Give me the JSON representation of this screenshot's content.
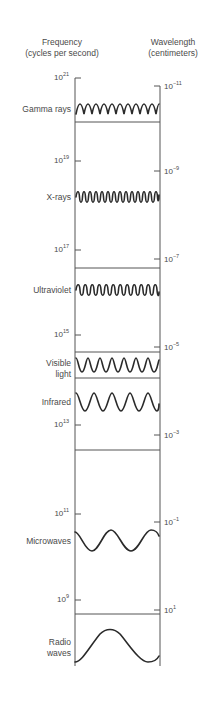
{
  "headers": {
    "frequency_title": "Frequency",
    "frequency_unit": "(cycles per second)",
    "wavelength_title": "Wavelength",
    "wavelength_unit": "(centimeters)"
  },
  "frequency_ticks": [
    {
      "base": "10",
      "exp": "21",
      "y": 78
    },
    {
      "base": "10",
      "exp": "19",
      "y": 161
    },
    {
      "base": "10",
      "exp": "17",
      "y": 250
    },
    {
      "base": "10",
      "exp": "15",
      "y": 335
    },
    {
      "base": "10",
      "exp": "13",
      "y": 425
    },
    {
      "base": "10",
      "exp": "11",
      "y": 514
    },
    {
      "base": "10",
      "exp": "9",
      "y": 600
    }
  ],
  "wavelength_ticks": [
    {
      "base": "10",
      "exp": "−11",
      "y": 86
    },
    {
      "base": "10",
      "exp": "−9",
      "y": 171
    },
    {
      "base": "10",
      "exp": "−7",
      "y": 259
    },
    {
      "base": "10",
      "exp": "−5",
      "y": 347
    },
    {
      "base": "10",
      "exp": "−3",
      "y": 435
    },
    {
      "base": "10",
      "exp": "−1",
      "y": 522
    },
    {
      "base": "10",
      "exp": "1",
      "y": 610
    }
  ],
  "bands": [
    {
      "name": "Gamma rays",
      "lines": [
        "Gamma rays"
      ],
      "label_y": 104
    },
    {
      "name": "X-rays",
      "lines": [
        "X-rays"
      ],
      "label_y": 192
    },
    {
      "name": "Ultraviolet",
      "lines": [
        "Ultraviolet"
      ],
      "label_y": 285
    },
    {
      "name": "Visible light",
      "lines": [
        "Visible",
        "light"
      ],
      "label_y": 358
    },
    {
      "name": "Infrared",
      "lines": [
        "Infrared"
      ],
      "label_y": 397
    },
    {
      "name": "Microwaves",
      "lines": [
        "Microwaves"
      ],
      "label_y": 536
    },
    {
      "name": "Radio waves",
      "lines": [
        "Radio",
        "waves"
      ],
      "label_y": 637
    }
  ],
  "colors": {
    "line": "#555555",
    "wave": "#2a2a2a",
    "text": "#4a4a4a"
  }
}
